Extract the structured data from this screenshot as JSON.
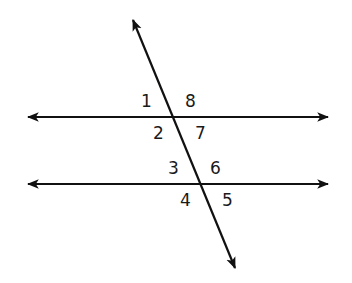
{
  "diagram": {
    "type": "parallel-lines-cut-by-transversal",
    "stroke_color": "#111111",
    "background": "#ffffff",
    "lines": {
      "upper_parallel": {
        "x1": 28,
        "y1": 117,
        "x2": 328,
        "y2": 117
      },
      "lower_parallel": {
        "x1": 28,
        "y1": 184,
        "x2": 328,
        "y2": 184
      },
      "transversal": {
        "x1": 133,
        "y1": 20,
        "x2": 235,
        "y2": 268
      }
    },
    "angle_labels": [
      {
        "id": "1",
        "text": "1",
        "x": 141,
        "y": 107
      },
      {
        "id": "8",
        "text": "8",
        "x": 185,
        "y": 107
      },
      {
        "id": "2",
        "text": "2",
        "x": 153,
        "y": 139
      },
      {
        "id": "7",
        "text": "7",
        "x": 195,
        "y": 139
      },
      {
        "id": "3",
        "text": "3",
        "x": 168,
        "y": 174
      },
      {
        "id": "6",
        "text": "6",
        "x": 210,
        "y": 174
      },
      {
        "id": "4",
        "text": "4",
        "x": 180,
        "y": 206
      },
      {
        "id": "5",
        "text": "5",
        "x": 222,
        "y": 206
      }
    ]
  }
}
